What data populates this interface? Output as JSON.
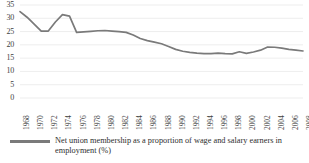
{
  "chart_data": {
    "type": "line",
    "title": "",
    "subtitle": "",
    "xlabel": "",
    "ylabel": "",
    "ylim": [
      0,
      35
    ],
    "yticks": [
      0,
      5,
      10,
      15,
      20,
      25,
      30,
      35
    ],
    "xticks": [
      "1968",
      "1970",
      "1972",
      "1974",
      "1976",
      "1978",
      "1980",
      "1982",
      "1984",
      "1986",
      "1988",
      "1990",
      "1992",
      "1994",
      "1996",
      "1998",
      "2000",
      "2002",
      "2004",
      "2006",
      "2008"
    ],
    "grid": true,
    "grid_axis": "y",
    "legend_position": "bottom",
    "line_color": "#7a7a7a",
    "series": [
      {
        "name": "Net union membership as a proportion of wage and salary earners in employment (%)",
        "x": [
          1968,
          1969,
          1970,
          1971,
          1972,
          1973,
          1974,
          1975,
          1976,
          1977,
          1978,
          1979,
          1980,
          1981,
          1982,
          1983,
          1984,
          1985,
          1986,
          1987,
          1988,
          1989,
          1990,
          1991,
          1992,
          1993,
          1994,
          1995,
          1996,
          1997,
          1998,
          1999,
          2000,
          2001,
          2002,
          2003,
          2004,
          2005,
          2006,
          2007,
          2008
        ],
        "values": [
          32.5,
          30.4,
          27.8,
          25.2,
          25.2,
          28.6,
          31.4,
          30.8,
          24.7,
          24.9,
          25.1,
          25.3,
          25.4,
          25.2,
          25.0,
          24.7,
          23.7,
          22.4,
          21.6,
          21.0,
          20.4,
          19.4,
          18.3,
          17.6,
          17.2,
          16.9,
          16.7,
          16.7,
          16.9,
          16.7,
          16.6,
          17.4,
          16.8,
          17.3,
          18.0,
          19.2,
          19.1,
          18.8,
          18.3,
          18.0,
          17.7
        ]
      }
    ]
  },
  "legend": {
    "label": "Net union membership as a proportion of wage and salary earners in employment (%)"
  }
}
